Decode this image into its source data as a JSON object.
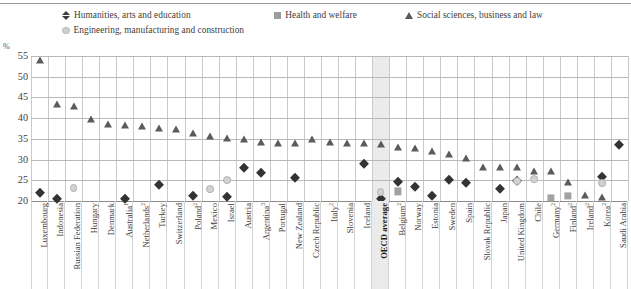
{
  "axis": {
    "unit_label": "%",
    "y_ticks": [
      55,
      50,
      45,
      40,
      35,
      30,
      25,
      20
    ],
    "y_min": 20,
    "y_max": 55
  },
  "legend": {
    "items": [
      {
        "label": "Humanities, arts and education",
        "marker": "diamond",
        "color": "#3c3c3c"
      },
      {
        "label": "Health and welfare",
        "marker": "square",
        "color": "#9d9d9d"
      },
      {
        "label": "Social sciences, business and law",
        "marker": "triangle",
        "color": "#5a5a5a"
      },
      {
        "label": "Engineering, manufacturing and construction",
        "marker": "circle",
        "color": "#cfcfcf"
      }
    ]
  },
  "chart_data": {
    "type": "scatter",
    "title": "",
    "xlabel": "",
    "ylabel": "%",
    "ylim": [
      20,
      55
    ],
    "grid": true,
    "legend_position": "top",
    "categories": [
      "Luxembourg",
      "Indonesia",
      "Russian Federation",
      "Hungary",
      "Denmark",
      "Australia¹",
      "Netherlands²",
      "Turkey",
      "Switzerland",
      "Poland²",
      "Mexico",
      "Israel",
      "Austria",
      "Argentina³",
      "Portugal",
      "New Zealand",
      "Czech Republic",
      "Italy²",
      "Slovenia",
      "Iceland",
      "OECD average",
      "Belgium²",
      "Norway",
      "Estonia",
      "Sweden",
      "Spain",
      "Slovak Republic",
      "Japan",
      "United Kingdom",
      "Chile",
      "Germany²",
      "Finland²",
      "Ireland²",
      "Korea²",
      "Saudi Arabia"
    ],
    "highlight_category": "OECD average",
    "series": [
      {
        "name": "Humanities, arts and education",
        "marker": "diamond",
        "values": [
          21.9,
          20.6,
          null,
          null,
          null,
          20.5,
          null,
          23.9,
          null,
          21.3,
          null,
          21.0,
          28.0,
          26.7,
          null,
          25.5,
          null,
          null,
          null,
          28.9,
          20.5,
          24.5,
          23.4,
          21.1,
          25.0,
          24.4,
          null,
          22.9,
          24.8,
          null,
          null,
          null,
          null,
          25.9,
          33.6
        ]
      },
      {
        "name": "Health and welfare",
        "marker": "square",
        "values": [
          null,
          null,
          null,
          null,
          null,
          null,
          null,
          null,
          null,
          null,
          null,
          null,
          null,
          null,
          null,
          null,
          null,
          null,
          null,
          null,
          null,
          22.3,
          null,
          null,
          null,
          null,
          null,
          null,
          null,
          null,
          20.8,
          21.3,
          null,
          null,
          null
        ]
      },
      {
        "name": "Social sciences, business and law",
        "marker": "triangle",
        "values": [
          54.0,
          43.3,
          42.9,
          39.8,
          38.7,
          38.4,
          38.1,
          37.6,
          37.3,
          36.3,
          35.8,
          35.1,
          34.9,
          34.2,
          34.0,
          34.0,
          35.0,
          34.3,
          33.9,
          34.0,
          33.7,
          33.1,
          32.9,
          32.0,
          31.3,
          30.5,
          28.2,
          28.3,
          28.1,
          27.3,
          27.3,
          24.7,
          21.5,
          21.0,
          null
        ]
      },
      {
        "name": "Engineering, manufacturing and construction",
        "marker": "circle",
        "values": [
          null,
          null,
          23.2,
          null,
          null,
          null,
          null,
          null,
          null,
          null,
          22.8,
          25.1,
          null,
          null,
          null,
          null,
          null,
          null,
          null,
          null,
          22.1,
          null,
          null,
          null,
          null,
          null,
          null,
          null,
          24.8,
          25.2,
          null,
          null,
          null,
          24.3,
          null
        ]
      }
    ]
  }
}
